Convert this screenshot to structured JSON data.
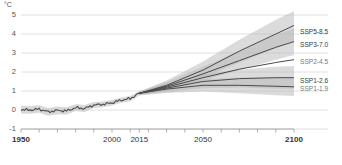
{
  "axes": {
    "unit": "°C",
    "y_ticks": [
      "5",
      "4",
      "3",
      "2",
      "1",
      "0",
      "-1"
    ],
    "y_values": [
      5,
      4,
      3,
      2,
      1,
      0,
      -1
    ],
    "x_ticks": [
      "1950",
      "2000",
      "2015",
      "2050",
      "2100"
    ],
    "x_values": [
      1950,
      2000,
      2015,
      2050,
      2100
    ],
    "ylim": [
      -1,
      5
    ],
    "xlim": [
      1950,
      2100
    ]
  },
  "scenario_labels": [
    {
      "id": "ssp5-85",
      "text": "SSP5-8.5",
      "dim": false
    },
    {
      "id": "ssp3-70",
      "text": "SSP3-7.0",
      "dim": false
    },
    {
      "id": "ssp2-45",
      "text": "SSP2-4.5",
      "dim": true
    },
    {
      "id": "ssp1-26",
      "text": "SSP1-2.6",
      "dim": false
    },
    {
      "id": "ssp1-19",
      "text": "SSP1-1.9",
      "dim": true
    }
  ],
  "colors": {
    "line": "#4a4a4a",
    "band": "#b8b8b8",
    "grid": "#d8d8d8",
    "axis": "#9a9a9a",
    "text": "#333333"
  },
  "chart_data": {
    "type": "line",
    "title": "",
    "xlabel": "",
    "ylabel": "°C",
    "xlim": [
      1950,
      2100
    ],
    "ylim": [
      -1,
      5
    ],
    "grid": true,
    "legend_position": "right-inline",
    "historical": {
      "name": "historical",
      "x": [
        1950,
        1955,
        1960,
        1965,
        1970,
        1975,
        1980,
        1985,
        1990,
        1995,
        2000,
        2005,
        2010,
        2015
      ],
      "values": [
        0.02,
        0.0,
        0.05,
        -0.1,
        -0.02,
        -0.05,
        0.12,
        0.08,
        0.26,
        0.3,
        0.38,
        0.52,
        0.6,
        0.88
      ],
      "band_low": [
        -0.18,
        -0.2,
        -0.15,
        -0.3,
        -0.22,
        -0.25,
        -0.05,
        -0.1,
        0.1,
        0.15,
        0.24,
        0.38,
        0.46,
        0.76
      ],
      "band_high": [
        0.22,
        0.2,
        0.25,
        0.1,
        0.18,
        0.15,
        0.3,
        0.26,
        0.42,
        0.45,
        0.52,
        0.66,
        0.74,
        1.0
      ]
    },
    "series": [
      {
        "name": "SSP5-8.5",
        "x": [
          2015,
          2030,
          2050,
          2070,
          2090,
          2100
        ],
        "values": [
          0.88,
          1.3,
          2.1,
          3.1,
          4.0,
          4.45
        ],
        "band_low": [
          0.78,
          1.05,
          1.7,
          2.5,
          3.25,
          3.65
        ],
        "band_high": [
          0.98,
          1.55,
          2.55,
          3.7,
          4.75,
          5.2
        ]
      },
      {
        "name": "SSP3-7.0",
        "x": [
          2015,
          2030,
          2050,
          2070,
          2090,
          2100
        ],
        "values": [
          0.88,
          1.25,
          1.9,
          2.6,
          3.3,
          3.6
        ],
        "band_low": [
          0.78,
          1.02,
          1.55,
          2.1,
          2.65,
          2.9
        ],
        "band_high": [
          0.98,
          1.48,
          2.28,
          3.1,
          3.95,
          4.3
        ]
      },
      {
        "name": "SSP2-4.5",
        "x": [
          2015,
          2030,
          2050,
          2070,
          2090,
          2100
        ],
        "values": [
          0.88,
          1.2,
          1.7,
          2.15,
          2.5,
          2.65
        ],
        "band_low": [
          0.88,
          1.2,
          1.7,
          2.15,
          2.5,
          2.65
        ],
        "band_high": [
          0.88,
          1.2,
          1.7,
          2.15,
          2.5,
          2.65
        ]
      },
      {
        "name": "SSP1-2.6",
        "x": [
          2015,
          2030,
          2050,
          2070,
          2090,
          2100
        ],
        "values": [
          0.88,
          1.15,
          1.5,
          1.65,
          1.7,
          1.7
        ],
        "band_low": [
          0.78,
          0.95,
          1.15,
          1.18,
          1.12,
          1.1
        ],
        "band_high": [
          0.98,
          1.38,
          1.88,
          2.12,
          2.28,
          2.32
        ]
      },
      {
        "name": "SSP1-1.9",
        "x": [
          2015,
          2030,
          2050,
          2070,
          2090,
          2100
        ],
        "values": [
          0.88,
          1.1,
          1.3,
          1.3,
          1.25,
          1.22
        ],
        "band_low": [
          0.78,
          0.9,
          0.98,
          0.88,
          0.78,
          0.74
        ],
        "band_high": [
          0.98,
          1.32,
          1.62,
          1.7,
          1.72,
          1.72
        ]
      }
    ]
  }
}
